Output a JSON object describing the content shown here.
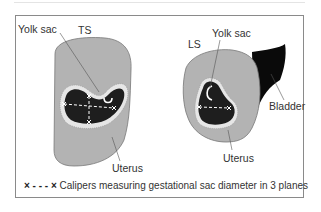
{
  "figure": {
    "panels": [
      {
        "id": "transverse",
        "plane_label": "TS",
        "labels": {
          "yolk_sac": "Yolk sac",
          "uterus": "Uterus"
        }
      },
      {
        "id": "longitudinal",
        "plane_label": "LS",
        "labels": {
          "yolk_sac": "Yolk sac",
          "bladder": "Bladder",
          "uterus": "Uterus"
        }
      }
    ],
    "legend": {
      "marker": "× - - - ×",
      "text": "Calipers measuring gestational sac diameter in 3 planes"
    },
    "colors": {
      "uterus": "#b3b3b3",
      "sac_rim": "#e6e6e6",
      "sac_fluid": "#1e1e1e",
      "bladder": "#0a0a0a",
      "outline": "#777777",
      "caliper": "#ffffff",
      "frame": "#8a8a8a"
    }
  }
}
